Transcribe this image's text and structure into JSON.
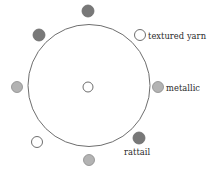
{
  "figure": {
    "type": "circular-node-diagram",
    "background_color": "#ffffff",
    "outline_color": "#6e6e6e",
    "text_color": "#2b2b2b"
  },
  "ring": {
    "center_x": 89,
    "center_y": 85.5,
    "radius": 61,
    "stroke_width": 1
  },
  "marker_styles": {
    "open": {
      "fill": "#ffffff",
      "stroke": "#6e6e6e"
    },
    "light_gray": {
      "fill": "#b3b3b3",
      "stroke": "#8a8a8a"
    },
    "dark_gray": {
      "fill": "#787878",
      "stroke": "#6b6b6b"
    }
  },
  "center_node": {
    "name": "center-node",
    "x": 88,
    "y": 87,
    "r": 5,
    "style": "open"
  },
  "ring_nodes": [
    {
      "name": "node-top",
      "x": 88,
      "y": 11,
      "r": 6,
      "style": "dark_gray"
    },
    {
      "name": "node-upper-left",
      "x": 39,
      "y": 35,
      "r": 6,
      "style": "dark_gray"
    },
    {
      "name": "node-left",
      "x": 17,
      "y": 87,
      "r": 5.5,
      "style": "light_gray"
    },
    {
      "name": "node-lower-left",
      "x": 37,
      "y": 142,
      "r": 5.5,
      "style": "open"
    },
    {
      "name": "node-bottom",
      "x": 89,
      "y": 160,
      "r": 5.5,
      "style": "light_gray"
    },
    {
      "name": "node-lower-right",
      "x": 139,
      "y": 138,
      "r": 6,
      "style": "dark_gray"
    },
    {
      "name": "node-right",
      "x": 158,
      "y": 87,
      "r": 5.5,
      "style": "light_gray"
    },
    {
      "name": "node-upper-right",
      "x": 140,
      "y": 35,
      "r": 5.5,
      "style": "open"
    }
  ],
  "legend": {
    "items": [
      {
        "key": "textured_yarn",
        "label": "textured yarn",
        "marker_style": "open",
        "marker_x": 140,
        "marker_y": 35,
        "marker_r": 5.5
      },
      {
        "key": "metallic",
        "label": "metallic",
        "marker_style": "light_gray",
        "marker_x": 158,
        "marker_y": 87,
        "marker_r": 5.5
      },
      {
        "key": "rattail",
        "label": "rattail",
        "marker_style": "dark_gray",
        "marker_x": 139,
        "marker_y": 138,
        "marker_r": 6
      }
    ]
  }
}
